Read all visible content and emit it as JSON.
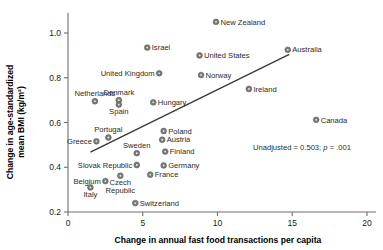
{
  "chart_data": {
    "type": "scatter",
    "title": "",
    "xlabel": "Change in annual fast food transactions per capita",
    "ylabel": "Change in age-standardized mean BMI (kg/m²)",
    "xlim": [
      0,
      20.8
    ],
    "ylim": [
      0.2,
      1.09
    ],
    "xticks": [
      0,
      5,
      10,
      15,
      20
    ],
    "xticklabels": [
      "0",
      "5",
      "10",
      "15",
      "20"
    ],
    "yticks": [
      0.2,
      0.4,
      0.6,
      0.8,
      1.0
    ],
    "yticklabels": [
      "0.2",
      "0.4",
      "0.6",
      "0.8",
      "1.0"
    ],
    "grid": false,
    "legend": "none",
    "annotation": "Unadjusted = 0.503; p = .001",
    "annotation_stat": "Unadjusted = 0.503;",
    "annotation_p_italic": "p",
    "annotation_p_value": " = .001",
    "trendline": {
      "type": "linear-fit",
      "x_start": 1.5,
      "y_start": 0.468,
      "x_end": 14.8,
      "y_end": 0.905
    },
    "points": [
      {
        "name": "New Zealand",
        "x": 9.9,
        "y": 1.05,
        "label_side": "right"
      },
      {
        "name": "Israel",
        "x": 5.3,
        "y": 0.935,
        "label_side": "right"
      },
      {
        "name": "Australia",
        "x": 14.7,
        "y": 0.925,
        "label_side": "right"
      },
      {
        "name": "United States",
        "x": 8.8,
        "y": 0.9,
        "label_side": "right"
      },
      {
        "name": "United Kingdom",
        "x": 6.1,
        "y": 0.82,
        "label_side": "left"
      },
      {
        "name": "Norway",
        "x": 8.9,
        "y": 0.812,
        "label_side": "right"
      },
      {
        "name": "Ireland",
        "x": 12.1,
        "y": 0.75,
        "label_side": "right"
      },
      {
        "name": "Denmark",
        "x": 3.4,
        "y": 0.7,
        "label_side": "above"
      },
      {
        "name": "Netherlands",
        "x": 1.8,
        "y": 0.695,
        "label_side": "above"
      },
      {
        "name": "Hungary",
        "x": 5.7,
        "y": 0.69,
        "label_side": "right"
      },
      {
        "name": "Spain",
        "x": 3.4,
        "y": 0.68,
        "label_side": "below"
      },
      {
        "name": "Canada",
        "x": 16.6,
        "y": 0.612,
        "label_side": "right"
      },
      {
        "name": "Poland",
        "x": 6.4,
        "y": 0.562,
        "label_side": "right"
      },
      {
        "name": "Portugal",
        "x": 2.7,
        "y": 0.533,
        "label_side": "above"
      },
      {
        "name": "Austria",
        "x": 6.3,
        "y": 0.523,
        "label_side": "right"
      },
      {
        "name": "Greece",
        "x": 1.9,
        "y": 0.516,
        "label_side": "left"
      },
      {
        "name": "Finland",
        "x": 6.5,
        "y": 0.47,
        "label_side": "right"
      },
      {
        "name": "Sweden",
        "x": 4.6,
        "y": 0.463,
        "label_side": "above"
      },
      {
        "name": "Slovak Republic",
        "x": 4.6,
        "y": 0.41,
        "label_side": "left"
      },
      {
        "name": "Germany",
        "x": 6.4,
        "y": 0.408,
        "label_side": "right"
      },
      {
        "name": "France",
        "x": 5.5,
        "y": 0.367,
        "label_side": "right"
      },
      {
        "name": "Czech Republic",
        "x": 3.5,
        "y": 0.362,
        "label_side": "below"
      },
      {
        "name": "Belgium",
        "x": 2.5,
        "y": 0.338,
        "label_side": "left"
      },
      {
        "name": "Italy",
        "x": 1.5,
        "y": 0.31,
        "label_side": "below"
      },
      {
        "name": "Switzerland",
        "x": 4.5,
        "y": 0.24,
        "label_side": "right"
      }
    ]
  }
}
